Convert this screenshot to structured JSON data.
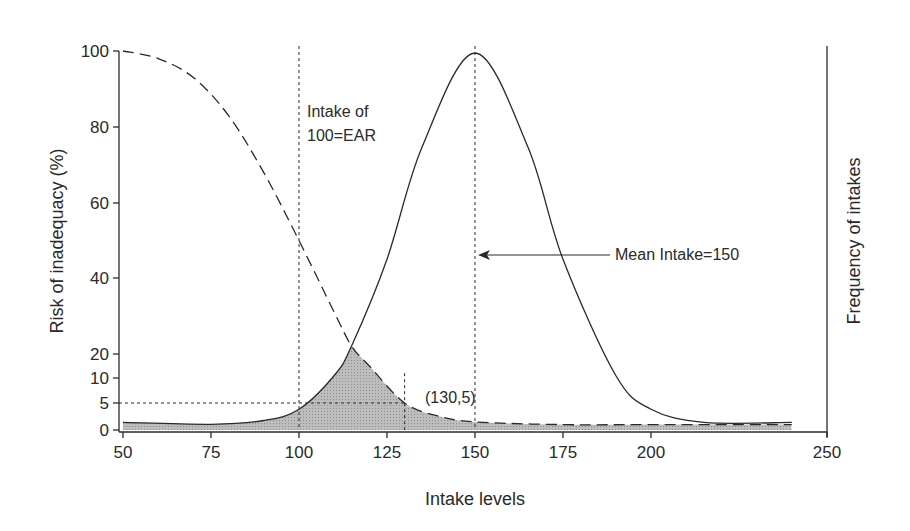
{
  "chart_data": {
    "type": "line",
    "title": "",
    "xlabel": "Intake levels",
    "ylabel": "Risk of inadequacy (%)",
    "y2label": "Frequency of intakes",
    "xlim": [
      50,
      250
    ],
    "ylim": [
      0,
      100
    ],
    "x_ticks": [
      50,
      75,
      100,
      125,
      150,
      175,
      200,
      250
    ],
    "y_ticks": [
      0,
      5,
      10,
      20,
      40,
      60,
      80,
      100
    ],
    "y_axis_scale_note": "non-linear: lower range (0-20) stretched",
    "grid": false,
    "legend": null,
    "series": [
      {
        "name": "Risk of inadequacy",
        "style": "dashed",
        "axis": "left",
        "x": [
          50,
          60,
          70,
          80,
          90,
          100,
          110,
          115,
          120,
          130,
          140,
          150,
          175,
          200,
          240
        ],
        "y": [
          100,
          98,
          93,
          83,
          68,
          50,
          31,
          22,
          15,
          5,
          2.5,
          1.5,
          1,
          1,
          1
        ]
      },
      {
        "name": "Frequency of intakes (distribution)",
        "style": "solid",
        "axis": "right",
        "mean": 150,
        "x": [
          50,
          75,
          90,
          100,
          110,
          115,
          125,
          135,
          150,
          165,
          175,
          190,
          200,
          215,
          240
        ],
        "y_relative": [
          1.5,
          1,
          2,
          5,
          14,
          22,
          45,
          75,
          100,
          75,
          45,
          14,
          5,
          1.5,
          1.5
        ]
      }
    ],
    "shaded_region": {
      "description": "Area under the minimum of the two curves (intakes at risk)",
      "fill": "#b8b8b8"
    },
    "reference_lines": [
      {
        "type": "vertical",
        "x": 100,
        "style": "dotted",
        "label": "Intake of 100=EAR"
      },
      {
        "type": "vertical",
        "x": 150,
        "style": "dotted",
        "label": "Mean Intake=150"
      },
      {
        "type": "vertical",
        "x": 130,
        "y_top": 12,
        "style": "dotted"
      },
      {
        "type": "horizontal",
        "y": 5,
        "x_end": 130,
        "style": "dotted"
      }
    ],
    "annotations": [
      {
        "text_lines": [
          "Intake of",
          "100=EAR"
        ],
        "x": 101,
        "y": 88
      },
      {
        "text": "Mean Intake=150",
        "arrow_to_x": 150,
        "y": 47
      },
      {
        "text": "(130,5)",
        "x": 131,
        "y": 5
      }
    ]
  },
  "labels": {
    "xlabel": "Intake levels",
    "ylabel": "Risk of inadequacy (%)",
    "y2label": "Frequency of intakes",
    "ear_line1": "Intake of",
    "ear_line2": "100=EAR",
    "mean_label": "Mean Intake=150",
    "point_label": "(130,5)"
  },
  "colors": {
    "ink": "#2a2a2a",
    "shade": "#b8b8b8",
    "background": "#ffffff"
  }
}
